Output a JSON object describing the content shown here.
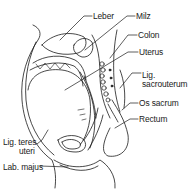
{
  "diagram": {
    "type": "anatomical-line-drawing",
    "stroke_color": "#1a1a1a",
    "background": "#ffffff",
    "labels": [
      {
        "id": "leber",
        "text": "Leber",
        "x": 93,
        "y": 12
      },
      {
        "id": "milz",
        "text": "Milz",
        "x": 136,
        "y": 12
      },
      {
        "id": "colon",
        "text": "Colon",
        "x": 138,
        "y": 31
      },
      {
        "id": "uterus",
        "text": "Uterus",
        "x": 139,
        "y": 48
      },
      {
        "id": "lig-sacrouterum-1",
        "text": "Lig.",
        "x": 142,
        "y": 71
      },
      {
        "id": "lig-sacrouterum-2",
        "text": "sacrouterum",
        "x": 142,
        "y": 80
      },
      {
        "id": "os-sacrum",
        "text": "Os sacrum",
        "x": 139,
        "y": 99
      },
      {
        "id": "rectum",
        "text": "Rectum",
        "x": 139,
        "y": 115
      },
      {
        "id": "lig-teres-1",
        "text": "Lig. teres",
        "x": 3,
        "y": 138
      },
      {
        "id": "lig-teres-2",
        "text": "uteri",
        "x": 19,
        "y": 147
      },
      {
        "id": "lab-majus",
        "text": "Lab. majus",
        "x": 3,
        "y": 163
      }
    ]
  }
}
